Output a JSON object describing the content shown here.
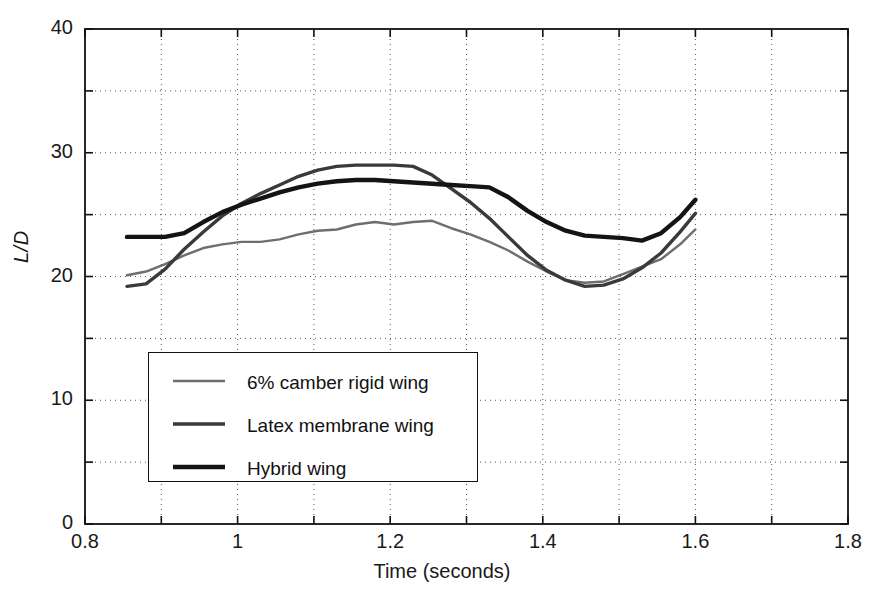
{
  "chart_data": {
    "type": "line",
    "title": "",
    "xlabel": "Time (seconds)",
    "ylabel": "L/D",
    "xlim": [
      0.8,
      1.8
    ],
    "ylim": [
      0,
      40
    ],
    "grid": true,
    "legend_position": "lower-left-inside",
    "x_ticks": [
      0.8,
      0.9,
      1.0,
      1.1,
      1.2,
      1.3,
      1.4,
      1.5,
      1.6,
      1.7,
      1.8
    ],
    "x_tick_labels": [
      "0.8",
      "",
      "1",
      "",
      "1.2",
      "",
      "1.4",
      "",
      "1.6",
      "",
      "1.8"
    ],
    "x_major_labels": [
      "0.8",
      "1",
      "1.2",
      "1.4",
      "1.6",
      "1.8"
    ],
    "x_major_values": [
      0.8,
      1.0,
      1.2,
      1.4,
      1.6,
      1.8
    ],
    "y_ticks": [
      0,
      5,
      10,
      15,
      20,
      25,
      30,
      35,
      40
    ],
    "y_tick_labels": [
      "0",
      "",
      "10",
      "",
      "20",
      "",
      "30",
      "",
      "40"
    ],
    "y_major_labels": [
      "0",
      "10",
      "20",
      "30",
      "40"
    ],
    "y_major_values": [
      0,
      10,
      20,
      30,
      40
    ],
    "series": [
      {
        "name": "6% camber rigid wing",
        "color": "#6e6e6e",
        "width": 2.4,
        "x": [
          0.855,
          0.88,
          0.905,
          0.93,
          0.955,
          0.98,
          1.005,
          1.03,
          1.055,
          1.08,
          1.105,
          1.13,
          1.155,
          1.18,
          1.205,
          1.23,
          1.255,
          1.28,
          1.305,
          1.33,
          1.355,
          1.38,
          1.405,
          1.43,
          1.455,
          1.48,
          1.505,
          1.53,
          1.555,
          1.58,
          1.6
        ],
        "y": [
          20.1,
          20.4,
          21.0,
          21.7,
          22.3,
          22.6,
          22.8,
          22.8,
          23.0,
          23.4,
          23.7,
          23.8,
          24.2,
          24.4,
          24.2,
          24.4,
          24.5,
          23.9,
          23.4,
          22.8,
          22.1,
          21.2,
          20.4,
          19.7,
          19.5,
          19.6,
          20.2,
          20.8,
          21.4,
          22.6,
          23.8
        ]
      },
      {
        "name": "Latex membrane wing",
        "color": "#3a3a3a",
        "width": 3.4,
        "x": [
          0.855,
          0.88,
          0.905,
          0.93,
          0.955,
          0.98,
          1.005,
          1.03,
          1.055,
          1.08,
          1.105,
          1.13,
          1.155,
          1.18,
          1.205,
          1.23,
          1.255,
          1.28,
          1.305,
          1.33,
          1.355,
          1.38,
          1.405,
          1.43,
          1.455,
          1.48,
          1.505,
          1.53,
          1.555,
          1.58,
          1.6
        ],
        "y": [
          19.2,
          19.4,
          20.6,
          22.2,
          23.6,
          24.9,
          25.9,
          26.7,
          27.4,
          28.1,
          28.6,
          28.9,
          29.0,
          29.0,
          29.0,
          28.9,
          28.2,
          27.1,
          26.0,
          24.7,
          23.2,
          21.7,
          20.5,
          19.7,
          19.2,
          19.3,
          19.8,
          20.7,
          21.9,
          23.6,
          25.1
        ]
      },
      {
        "name": "Hybrid wing",
        "color": "#141414",
        "width": 4.4,
        "x": [
          0.855,
          0.88,
          0.905,
          0.93,
          0.955,
          0.98,
          1.005,
          1.03,
          1.055,
          1.08,
          1.105,
          1.13,
          1.155,
          1.18,
          1.205,
          1.23,
          1.255,
          1.28,
          1.305,
          1.33,
          1.355,
          1.38,
          1.405,
          1.43,
          1.455,
          1.48,
          1.505,
          1.53,
          1.555,
          1.58,
          1.6
        ],
        "y": [
          23.2,
          23.2,
          23.2,
          23.5,
          24.4,
          25.2,
          25.8,
          26.3,
          26.8,
          27.2,
          27.5,
          27.7,
          27.8,
          27.8,
          27.7,
          27.6,
          27.5,
          27.4,
          27.3,
          27.2,
          26.4,
          25.3,
          24.4,
          23.7,
          23.3,
          23.2,
          23.1,
          22.9,
          23.5,
          24.8,
          26.2
        ]
      }
    ]
  },
  "legend": {
    "entries": [
      {
        "label": "6% camber rigid wing"
      },
      {
        "label": "Latex membrane wing"
      },
      {
        "label": "Hybrid wing"
      }
    ]
  }
}
